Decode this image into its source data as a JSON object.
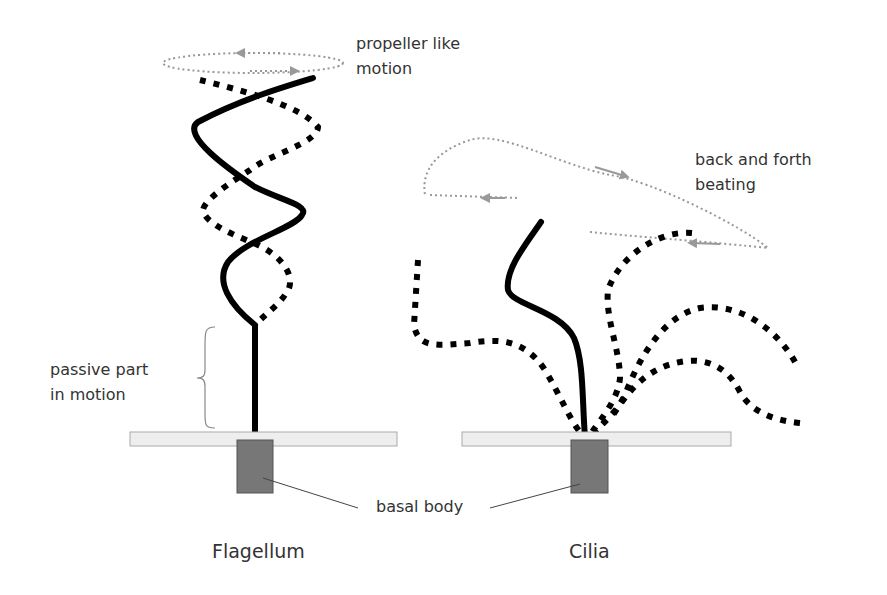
{
  "figure": {
    "labels": {
      "propeller_line1": "propeller like",
      "propeller_line2": "motion",
      "beating_line1": "back and forth",
      "beating_line2": "beating",
      "passive_line1": "passive part",
      "passive_line2": "in motion",
      "basal_body": "basal body",
      "flagellum": "Flagellum",
      "cilia": "Cilia"
    },
    "colors": {
      "stroke": "#000000",
      "motion_path": "#999999",
      "membrane_fill": "#eeeeee",
      "membrane_stroke": "#aaaaaa",
      "basal_fill": "#777777",
      "basal_stroke": "#555555",
      "text": "#333333"
    },
    "flagellum": {
      "solid_path": "M313,78 C280,88 240,100 198,122 C180,135 230,170 255,187 C280,200 310,205 302,215 C295,228 245,240 228,262 C215,282 230,305 255,325",
      "dashed_path": "M200,80 C240,90 300,105 318,127 C318,143 268,155 250,170 C235,180 205,198 203,210 C205,225 240,237 258,245 C285,258 298,280 285,295 C278,305 268,312 255,325",
      "shaft_path": "M255,325 L255,440",
      "brace_path": "M215,327 C205,327 205,332 205,345 L205,370 C205,376 203,378 197,378 C203,378 205,380 205,386 L205,413 C205,425 205,428 215,428",
      "propeller": {
        "cx": 253,
        "cy": 63,
        "rx": 90,
        "ry": 10
      },
      "membrane": {
        "x": 130,
        "y": 432,
        "w": 267,
        "h": 14
      },
      "basal": {
        "x": 237,
        "y": 440,
        "w": 36,
        "h": 53
      },
      "pointer_path": "M263,478 L358,508"
    },
    "cilia": {
      "solid_path": "M541,222 C525,245 505,270 508,290 C512,305 560,310 574,338 C584,362 582,400 585,437",
      "dashed_paths": [
        "M418,260 L414,325 C418,350 440,345 470,343 C500,338 525,340 545,370 C560,395 570,420 580,432",
        "M692,233 C660,230 620,255 608,290 C605,318 620,350 620,378 C618,400 600,420 592,432",
        "M795,362 C780,335 745,302 700,308 C665,315 640,355 625,395 C615,415 600,425 595,432",
        "M800,423 C770,420 750,410 740,392 C725,362 700,358 680,362 C645,368 625,395 610,420"
      ],
      "beating_loop_path": "M590,232 C640,237 690,240 768,248 C740,225 650,180 610,175 C560,165 500,130 470,140 C445,148 420,165 425,195 M430,195 L520,198",
      "membrane": {
        "x": 462,
        "y": 432,
        "w": 269,
        "h": 14
      },
      "basal": {
        "x": 571,
        "y": 440,
        "w": 37,
        "h": 53
      },
      "pointer_path": "M490,508 L580,484"
    }
  }
}
